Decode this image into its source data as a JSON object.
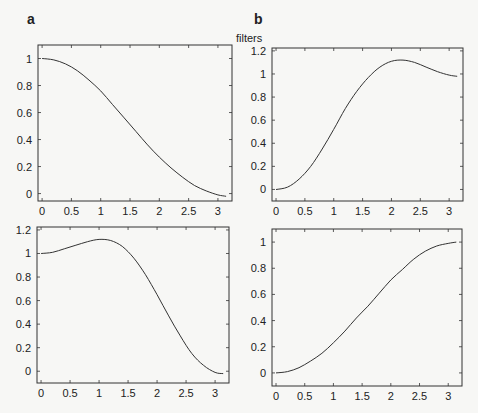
{
  "figure": {
    "panel_labels": [
      "a",
      "b"
    ],
    "title": "filters"
  },
  "chart_data": [
    {
      "type": "line",
      "panel": "a-top",
      "title": "",
      "xlabel": "",
      "ylabel": "",
      "xlim": [
        -0.07,
        3.24
      ],
      "ylim": [
        -0.055,
        1.1
      ],
      "xticks": [
        0,
        0.5,
        1,
        1.5,
        2,
        2.5,
        3
      ],
      "xtick_labels": [
        "0",
        "0.5",
        "1",
        "1.5",
        "2",
        "2.5",
        "3"
      ],
      "yticks": [
        0,
        0.2,
        0.4,
        0.6,
        0.8,
        1
      ],
      "ytick_labels": [
        "0",
        "0.2",
        "0.4",
        "0.6",
        "0.8",
        "1"
      ],
      "grid": false,
      "frame": {
        "left": 38,
        "top": 45,
        "right": 232,
        "bottom": 201
      },
      "series": [
        {
          "name": "filter",
          "x": [
            0,
            0.2,
            0.4,
            0.6,
            0.8,
            1.0,
            1.2,
            1.4,
            1.6,
            1.8,
            2.0,
            2.2,
            2.4,
            2.6,
            2.8,
            3.0,
            3.14
          ],
          "y": [
            1.0,
            0.99,
            0.96,
            0.91,
            0.84,
            0.76,
            0.66,
            0.56,
            0.46,
            0.36,
            0.27,
            0.19,
            0.12,
            0.06,
            0.02,
            -0.01,
            -0.02
          ]
        }
      ]
    },
    {
      "type": "line",
      "panel": "b-top",
      "title": "filters",
      "xlabel": "",
      "ylabel": "",
      "xlim": [
        -0.07,
        3.24
      ],
      "ylim": [
        -0.1,
        1.225
      ],
      "xticks": [
        0,
        0.5,
        1,
        1.5,
        2,
        2.5,
        3
      ],
      "xtick_labels": [
        "0",
        "0.5",
        "1",
        "1.5",
        "2",
        "2.5",
        "3"
      ],
      "yticks": [
        0,
        0.2,
        0.4,
        0.6,
        0.8,
        1,
        1.2
      ],
      "ytick_labels": [
        "0",
        "0.2",
        "0.4",
        "0.6",
        "0.8",
        "1",
        "1.2"
      ],
      "grid": false,
      "frame": {
        "left": 272,
        "top": 48,
        "right": 463,
        "bottom": 201
      },
      "series": [
        {
          "name": "filter",
          "x": [
            0,
            0.2,
            0.4,
            0.6,
            0.8,
            1.0,
            1.2,
            1.4,
            1.6,
            1.8,
            2.0,
            2.2,
            2.4,
            2.6,
            2.8,
            3.0,
            3.14
          ],
          "y": [
            0.0,
            0.02,
            0.09,
            0.2,
            0.35,
            0.52,
            0.7,
            0.85,
            0.97,
            1.06,
            1.11,
            1.12,
            1.1,
            1.06,
            1.02,
            0.99,
            0.98
          ]
        }
      ]
    },
    {
      "type": "line",
      "panel": "a-bottom",
      "title": "",
      "xlabel": "",
      "ylabel": "",
      "xlim": [
        -0.07,
        3.24
      ],
      "ylim": [
        -0.1,
        1.225
      ],
      "xticks": [
        0,
        0.5,
        1,
        1.5,
        2,
        2.5,
        3
      ],
      "xtick_labels": [
        "0",
        "0.5",
        "1",
        "1.5",
        "2",
        "2.5",
        "3"
      ],
      "yticks": [
        0,
        0.2,
        0.4,
        0.6,
        0.8,
        1,
        1.2
      ],
      "ytick_labels": [
        "0",
        "0.2",
        "0.4",
        "0.6",
        "0.8",
        "1",
        "1.2"
      ],
      "grid": false,
      "frame": {
        "left": 37,
        "top": 227,
        "right": 229,
        "bottom": 383
      },
      "series": [
        {
          "name": "filter",
          "x": [
            0,
            0.2,
            0.4,
            0.6,
            0.8,
            1.0,
            1.2,
            1.4,
            1.6,
            1.8,
            2.0,
            2.2,
            2.4,
            2.6,
            2.8,
            3.0,
            3.14
          ],
          "y": [
            1.0,
            1.01,
            1.04,
            1.07,
            1.1,
            1.12,
            1.11,
            1.06,
            0.96,
            0.82,
            0.65,
            0.47,
            0.3,
            0.15,
            0.05,
            -0.01,
            -0.02
          ]
        }
      ]
    },
    {
      "type": "line",
      "panel": "b-bottom",
      "title": "",
      "xlabel": "",
      "ylabel": "",
      "xlim": [
        -0.07,
        3.24
      ],
      "ylim": [
        -0.1,
        1.1
      ],
      "xticks": [
        0,
        0.5,
        1,
        1.5,
        2,
        2.5,
        3
      ],
      "xtick_labels": [
        "0",
        "0.5",
        "1",
        "1.5",
        "2",
        "2.5",
        "3"
      ],
      "yticks": [
        0,
        0.2,
        0.4,
        0.6,
        0.8,
        1
      ],
      "ytick_labels": [
        "0",
        "0.2",
        "0.4",
        "0.6",
        "0.8",
        "1"
      ],
      "grid": false,
      "frame": {
        "left": 272,
        "top": 229,
        "right": 462,
        "bottom": 386
      },
      "series": [
        {
          "name": "filter",
          "x": [
            0,
            0.2,
            0.4,
            0.6,
            0.8,
            1.0,
            1.2,
            1.4,
            1.6,
            1.8,
            2.0,
            2.2,
            2.4,
            2.6,
            2.8,
            3.0,
            3.14
          ],
          "y": [
            0.0,
            0.01,
            0.04,
            0.09,
            0.15,
            0.23,
            0.32,
            0.42,
            0.51,
            0.61,
            0.71,
            0.79,
            0.87,
            0.93,
            0.97,
            0.99,
            1.0
          ]
        }
      ]
    }
  ]
}
